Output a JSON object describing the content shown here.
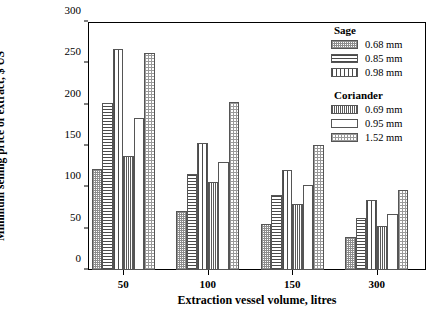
{
  "chart_data": {
    "type": "bar",
    "title": "",
    "xlabel": "Extraction vessel volume, litres",
    "ylabel": "Minimum selling price of extract, $ US",
    "categories": [
      "50",
      "100",
      "150",
      "300"
    ],
    "ylim": [
      0,
      300
    ],
    "yticks": [
      0,
      50,
      100,
      150,
      200,
      250,
      300
    ],
    "grid": false,
    "legend_position": "top-right-inside",
    "legend_groups": [
      {
        "heading": "Sage",
        "entries": [
          "0.68 mm",
          "0.85 mm",
          "0.98 mm"
        ]
      },
      {
        "heading": "Coriander",
        "entries": [
          "0.69 mm",
          "0.95 mm",
          "1.52 mm"
        ]
      }
    ],
    "series": [
      {
        "name": "Sage 0.68 mm",
        "pattern": "checker",
        "values": [
          122,
          71,
          56,
          40
        ]
      },
      {
        "name": "Sage 0.85 mm",
        "pattern": "horiz",
        "values": [
          202,
          116,
          91,
          63
        ]
      },
      {
        "name": "Sage 0.98 mm",
        "pattern": "vert-wide",
        "values": [
          267,
          154,
          121,
          85
        ]
      },
      {
        "name": "Coriander 0.69 mm",
        "pattern": "vert-fine",
        "values": [
          138,
          107,
          80,
          53
        ]
      },
      {
        "name": "Coriander 0.95 mm",
        "pattern": "empty",
        "values": [
          184,
          131,
          103,
          68
        ]
      },
      {
        "name": "Coriander 1.52 mm",
        "pattern": "stipple",
        "values": [
          262,
          203,
          151,
          97
        ]
      }
    ]
  }
}
